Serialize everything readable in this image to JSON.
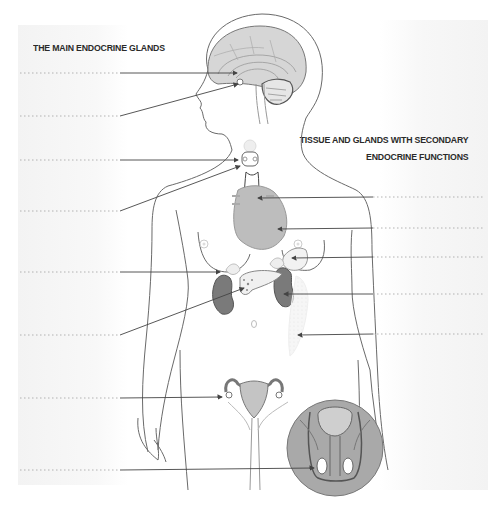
{
  "titles": {
    "main_glands": "THE MAIN ENDOCRINE GLANDS",
    "secondary_line1": "TISSUE AND GLANDS WITH SECONDARY",
    "secondary_line2": "ENDOCRINE FUNCTIONS"
  },
  "colors": {
    "line": "#555555",
    "dotted": "#9a9a9a",
    "organ_fill": "#bdbdbd",
    "kidney_fill": "#7a7a7a",
    "circle_fill": "#a9a9a9",
    "body_outline": "#6a6a6a"
  },
  "left_labels": [
    {
      "id": "hypothalamus-slot",
      "y": 73,
      "text": ""
    },
    {
      "id": "pituitary-slot",
      "y": 116,
      "text": ""
    },
    {
      "id": "thyroid-slot",
      "y": 160,
      "text": ""
    },
    {
      "id": "parathyroid-slot",
      "y": 211,
      "text": ""
    },
    {
      "id": "adrenal-slot",
      "y": 272,
      "text": ""
    },
    {
      "id": "pancreas-slot",
      "y": 335,
      "text": ""
    },
    {
      "id": "ovary-slot",
      "y": 398,
      "text": ""
    },
    {
      "id": "testis-slot",
      "y": 470,
      "text": ""
    }
  ],
  "right_labels": [
    {
      "id": "thymus-slot",
      "y": 197,
      "text": ""
    },
    {
      "id": "heart-slot",
      "y": 228,
      "text": ""
    },
    {
      "id": "stomach-slot",
      "y": 257,
      "text": ""
    },
    {
      "id": "kidney-slot",
      "y": 294,
      "text": ""
    },
    {
      "id": "adipose-slot",
      "y": 334,
      "text": ""
    }
  ]
}
